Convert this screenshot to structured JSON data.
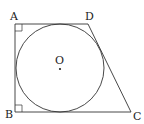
{
  "diagram": {
    "type": "geometry",
    "labels": {
      "A": "A",
      "B": "B",
      "C": "C",
      "D": "D",
      "O": "O"
    },
    "vertices": {
      "A": [
        15,
        24
      ],
      "B": [
        15,
        112
      ],
      "C": [
        131,
        112
      ],
      "D": [
        88,
        24
      ]
    },
    "circle": {
      "center": [
        60,
        68
      ],
      "radius": 44
    },
    "right_angles": [
      "A",
      "B"
    ],
    "stroke_color": "#333333"
  }
}
